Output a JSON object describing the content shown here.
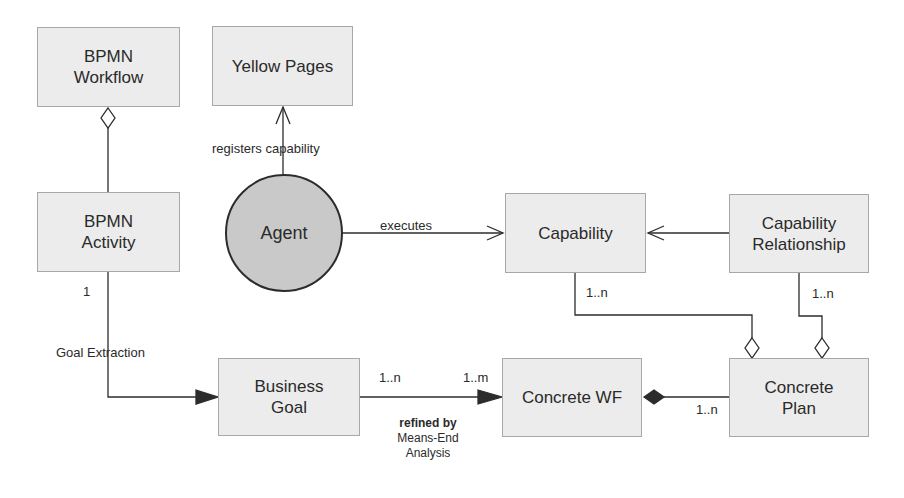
{
  "diagram": {
    "nodes": {
      "bpmn_workflow": {
        "line1": "BPMN",
        "line2": "Workflow"
      },
      "yellow_pages": {
        "label": "Yellow Pages"
      },
      "bpmn_activity": {
        "line1": "BPMN",
        "line2": "Activity"
      },
      "agent": {
        "label": "Agent"
      },
      "capability": {
        "label": "Capability"
      },
      "capability_relationship": {
        "line1": "Capability",
        "line2": "Relationship"
      },
      "business_goal": {
        "line1": "Business",
        "line2": "Goal"
      },
      "concrete_wf": {
        "label": "Concrete WF"
      },
      "concrete_plan": {
        "line1": "Concrete",
        "line2": "Plan"
      }
    },
    "edges": {
      "registers": {
        "label": "registers capability"
      },
      "executes": {
        "label": "executes"
      },
      "goal_extraction": {
        "label": "Goal Extraction",
        "mult_source": "1"
      },
      "refined": {
        "line1": "refined by",
        "line2": "Means-End",
        "line3": "Analysis",
        "mult_source": "1..n",
        "mult_target": "1..m"
      },
      "capability_plan": {
        "mult": "1..n"
      },
      "relationship_plan": {
        "mult": "1..n"
      },
      "plan_wf": {
        "mult": "1..n"
      }
    },
    "colors": {
      "box_fill": "#ececec",
      "box_border": "#a8a8a8",
      "agent_fill": "#c9c9c9",
      "line": "#2c2c2c"
    }
  }
}
